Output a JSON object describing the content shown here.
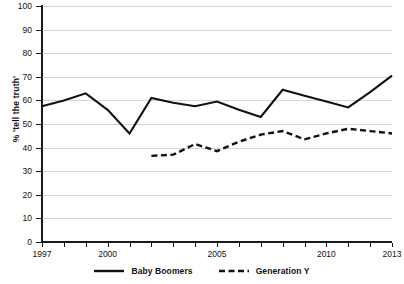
{
  "chart_data": {
    "type": "line",
    "title": "",
    "subtitle": "",
    "xlabel": "",
    "ylabel": "% 'tell the truth'",
    "xlim": [
      1997,
      2013
    ],
    "ylim": [
      0,
      100
    ],
    "grid": true,
    "legend_position": "bottom-center",
    "y_ticks": [
      0,
      10,
      20,
      30,
      40,
      50,
      60,
      70,
      80,
      90,
      100
    ],
    "x_ticks": [
      1997,
      1998,
      1999,
      2000,
      2001,
      2002,
      2003,
      2004,
      2005,
      2006,
      2007,
      2008,
      2009,
      2010,
      2011,
      2012,
      2013
    ],
    "x_tick_labels_shown": [
      "1997",
      "2000",
      "2005",
      "2010",
      "2013"
    ],
    "series": [
      {
        "name": "Baby Boomers",
        "style": "solid",
        "color": "#111111",
        "x": [
          1997,
          1998,
          1999,
          2000,
          2001,
          2002,
          2003,
          2004,
          2005,
          2006,
          2007,
          2008,
          2009,
          2010,
          2011,
          2012,
          2013
        ],
        "values": [
          57.5,
          60.0,
          63.0,
          56.0,
          46.0,
          61.0,
          59.0,
          57.5,
          59.5,
          56.0,
          53.0,
          64.5,
          62.0,
          59.5,
          57.0,
          63.5,
          70.5
        ]
      },
      {
        "name": "Generation Y",
        "style": "dashed",
        "color": "#111111",
        "x": [
          2002,
          2003,
          2004,
          2005,
          2006,
          2007,
          2008,
          2009,
          2010,
          2011,
          2012,
          2013
        ],
        "values": [
          36.5,
          37.0,
          41.5,
          38.5,
          42.5,
          45.5,
          47.0,
          43.5,
          46.0,
          48.0,
          47.0,
          46.0
        ]
      }
    ]
  },
  "legend": {
    "items": [
      {
        "label": "Baby Boomers",
        "style": "solid"
      },
      {
        "label": "Generation Y",
        "style": "dashed"
      }
    ]
  }
}
